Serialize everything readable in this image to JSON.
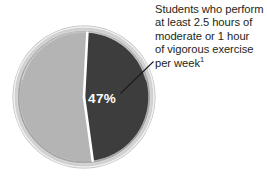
{
  "chart_data": {
    "type": "pie",
    "title": "",
    "categories": [
      "Students who perform at least 2.5 hours of moderate or 1 hour of vigorous exercise per week",
      "Other students"
    ],
    "values": [
      47,
      53
    ],
    "labels": [
      "47%",
      ""
    ],
    "colors": [
      "#3d3d3d",
      "#b4b4b4"
    ],
    "legend": "none",
    "annotation": "Students who perform at least 2.5 hours of moderate or 1 hour of vigorous exercise per week¹"
  },
  "annotation": {
    "line1": "Students who perform",
    "line2": "at least 2.5 hours of",
    "line3": "moderate or 1 hour",
    "line4": "of vigorous exercise",
    "line5": "per week",
    "footnote_marker": "1"
  },
  "slice_label": {
    "highlighted": "47%"
  },
  "colors": {
    "slice_highlight": "#3d3d3d",
    "slice_other": "#b4b4b4",
    "bezel_outer": "#d9d9d9",
    "bezel_inner": "#a9a9a9",
    "divider": "#ffffff",
    "text": "#231f20",
    "leader_line": "#1a1a1a"
  }
}
